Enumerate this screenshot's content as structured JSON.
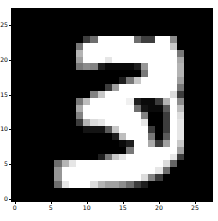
{
  "figure": {
    "title": "",
    "background_color": "#ffffff"
  },
  "chart_data": {
    "type": "heatmap",
    "title": "",
    "xlabel": "",
    "ylabel": "",
    "colormap": "gray",
    "vmin": 0,
    "vmax": 255,
    "grid": false,
    "legend": false,
    "origin": "upper",
    "extent": [
      -0.5,
      27.5,
      27.5,
      -0.5
    ],
    "xlim": [
      -0.5,
      27.5
    ],
    "ylim": [
      27.5,
      -0.5
    ],
    "xticks": [
      0,
      5,
      10,
      15,
      20,
      25
    ],
    "xtick_labels": [
      "0",
      "5",
      "10",
      "15",
      "20",
      "25"
    ],
    "yticks": [
      0,
      5,
      10,
      15,
      20,
      25
    ],
    "ytick_labels": [
      "0",
      "5",
      "10",
      "15",
      "20",
      "25"
    ],
    "rows": 28,
    "cols": 28,
    "depicted_digit": "3",
    "values": [
      [
        0,
        0,
        0,
        0,
        0,
        0,
        0,
        0,
        0,
        0,
        0,
        0,
        0,
        0,
        0,
        0,
        0,
        0,
        0,
        0,
        0,
        0,
        0,
        0,
        0,
        0,
        0,
        0
      ],
      [
        0,
        0,
        0,
        0,
        0,
        0,
        0,
        0,
        0,
        0,
        0,
        0,
        0,
        0,
        0,
        0,
        0,
        0,
        0,
        0,
        0,
        0,
        0,
        0,
        0,
        0,
        0,
        0
      ],
      [
        0,
        0,
        0,
        0,
        0,
        0,
        0,
        0,
        0,
        0,
        0,
        0,
        0,
        0,
        0,
        0,
        0,
        0,
        0,
        0,
        0,
        0,
        0,
        0,
        0,
        0,
        0,
        0
      ],
      [
        0,
        0,
        0,
        0,
        0,
        0,
        0,
        0,
        0,
        0,
        0,
        0,
        0,
        0,
        0,
        0,
        0,
        0,
        0,
        0,
        0,
        0,
        0,
        0,
        0,
        0,
        0,
        0
      ],
      [
        0,
        0,
        0,
        0,
        0,
        0,
        0,
        0,
        0,
        0,
        62,
        110,
        255,
        255,
        255,
        255,
        255,
        110,
        62,
        62,
        255,
        255,
        140,
        0,
        0,
        0,
        0,
        0
      ],
      [
        0,
        0,
        0,
        0,
        0,
        0,
        0,
        0,
        0,
        120,
        255,
        255,
        255,
        255,
        255,
        255,
        255,
        255,
        255,
        255,
        255,
        255,
        200,
        0,
        0,
        0,
        0,
        0
      ],
      [
        0,
        0,
        0,
        0,
        0,
        0,
        0,
        0,
        0,
        180,
        255,
        255,
        255,
        255,
        255,
        255,
        255,
        255,
        255,
        255,
        255,
        255,
        255,
        120,
        0,
        0,
        0,
        0
      ],
      [
        0,
        0,
        0,
        0,
        0,
        0,
        0,
        0,
        0,
        160,
        255,
        255,
        255,
        230,
        255,
        255,
        255,
        255,
        255,
        255,
        255,
        255,
        255,
        170,
        0,
        0,
        0,
        0
      ],
      [
        0,
        0,
        0,
        0,
        0,
        0,
        0,
        0,
        0,
        120,
        140,
        130,
        30,
        10,
        10,
        10,
        10,
        30,
        150,
        255,
        255,
        255,
        255,
        180,
        0,
        0,
        0,
        0
      ],
      [
        0,
        0,
        0,
        0,
        0,
        0,
        0,
        0,
        0,
        0,
        0,
        0,
        0,
        0,
        0,
        0,
        0,
        0,
        120,
        255,
        255,
        255,
        255,
        180,
        0,
        0,
        0,
        0
      ],
      [
        0,
        0,
        0,
        0,
        0,
        0,
        0,
        0,
        0,
        0,
        0,
        0,
        0,
        0,
        0,
        30,
        120,
        200,
        255,
        255,
        255,
        255,
        255,
        160,
        0,
        0,
        0,
        0
      ],
      [
        0,
        0,
        0,
        0,
        0,
        0,
        0,
        0,
        0,
        0,
        0,
        0,
        0,
        60,
        160,
        255,
        255,
        255,
        255,
        255,
        255,
        255,
        255,
        120,
        0,
        0,
        0,
        0
      ],
      [
        0,
        0,
        0,
        0,
        0,
        0,
        0,
        0,
        0,
        0,
        0,
        130,
        200,
        255,
        255,
        255,
        255,
        255,
        255,
        255,
        255,
        255,
        220,
        60,
        0,
        0,
        0,
        0
      ],
      [
        0,
        0,
        0,
        0,
        0,
        0,
        0,
        0,
        0,
        120,
        190,
        255,
        255,
        255,
        255,
        255,
        240,
        30,
        10,
        10,
        60,
        180,
        255,
        140,
        0,
        0,
        0,
        0
      ],
      [
        0,
        0,
        0,
        0,
        0,
        0,
        0,
        0,
        0,
        170,
        255,
        255,
        255,
        255,
        255,
        255,
        255,
        110,
        20,
        10,
        10,
        90,
        255,
        190,
        0,
        0,
        0,
        0
      ],
      [
        0,
        0,
        0,
        0,
        0,
        0,
        0,
        0,
        0,
        130,
        255,
        255,
        255,
        255,
        255,
        255,
        255,
        255,
        130,
        0,
        0,
        60,
        255,
        220,
        0,
        0,
        0,
        0
      ],
      [
        0,
        0,
        0,
        0,
        0,
        0,
        0,
        0,
        0,
        60,
        180,
        220,
        230,
        255,
        255,
        255,
        255,
        255,
        230,
        0,
        0,
        60,
        255,
        230,
        0,
        0,
        0,
        0
      ],
      [
        0,
        0,
        0,
        0,
        0,
        0,
        0,
        0,
        0,
        0,
        20,
        20,
        20,
        90,
        200,
        255,
        255,
        255,
        255,
        60,
        0,
        60,
        255,
        230,
        0,
        0,
        0,
        0
      ],
      [
        0,
        0,
        0,
        0,
        0,
        0,
        0,
        0,
        0,
        0,
        0,
        0,
        0,
        0,
        30,
        190,
        255,
        255,
        255,
        120,
        0,
        90,
        255,
        230,
        0,
        0,
        0,
        0
      ],
      [
        0,
        0,
        0,
        0,
        0,
        0,
        0,
        0,
        0,
        0,
        0,
        0,
        0,
        0,
        0,
        10,
        30,
        255,
        255,
        170,
        60,
        160,
        255,
        200,
        0,
        0,
        0,
        0
      ],
      [
        0,
        0,
        0,
        0,
        0,
        0,
        0,
        0,
        0,
        0,
        0,
        0,
        0,
        0,
        0,
        0,
        120,
        255,
        255,
        255,
        255,
        255,
        255,
        160,
        0,
        0,
        0,
        0
      ],
      [
        0,
        0,
        0,
        0,
        0,
        0,
        0,
        0,
        0,
        0,
        0,
        0,
        30,
        120,
        200,
        230,
        255,
        255,
        255,
        255,
        255,
        255,
        230,
        60,
        0,
        0,
        0,
        0
      ],
      [
        0,
        0,
        0,
        0,
        0,
        0,
        110,
        180,
        230,
        255,
        255,
        255,
        255,
        255,
        255,
        255,
        255,
        255,
        255,
        255,
        255,
        220,
        100,
        0,
        0,
        0,
        0,
        0
      ],
      [
        0,
        0,
        0,
        0,
        0,
        0,
        150,
        255,
        255,
        255,
        255,
        255,
        255,
        255,
        255,
        255,
        255,
        255,
        255,
        255,
        230,
        110,
        0,
        0,
        0,
        0,
        0,
        0
      ],
      [
        0,
        0,
        0,
        0,
        0,
        0,
        150,
        255,
        255,
        255,
        255,
        255,
        255,
        255,
        255,
        255,
        255,
        255,
        220,
        130,
        60,
        0,
        0,
        0,
        0,
        0,
        0,
        0
      ],
      [
        0,
        0,
        0,
        0,
        0,
        0,
        110,
        230,
        255,
        255,
        255,
        220,
        180,
        160,
        160,
        140,
        110,
        60,
        30,
        0,
        0,
        0,
        0,
        0,
        0,
        0,
        0,
        0
      ],
      [
        0,
        0,
        0,
        0,
        0,
        0,
        0,
        0,
        0,
        0,
        0,
        0,
        0,
        0,
        0,
        0,
        0,
        0,
        0,
        0,
        0,
        0,
        0,
        0,
        0,
        0,
        0,
        0
      ],
      [
        0,
        0,
        0,
        0,
        0,
        0,
        0,
        0,
        0,
        0,
        0,
        0,
        0,
        0,
        0,
        0,
        0,
        0,
        0,
        0,
        0,
        0,
        0,
        0,
        0,
        0,
        0,
        0
      ]
    ]
  },
  "axes_ui": {
    "xaxis_name": "x-axis",
    "yaxis_name": "y-axis"
  }
}
